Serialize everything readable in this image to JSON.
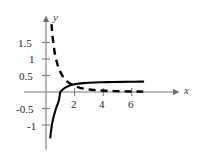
{
  "figure": {
    "background_color": "#ffffff",
    "width": 197,
    "height": 157,
    "axis_color": "#6e6e6e",
    "curve_color": "#000000",
    "label_color": "#262626"
  },
  "axes": {
    "x_axis_label": "x",
    "y_axis_label": "y",
    "x_ticks": [
      {
        "value": 2,
        "label": "2"
      },
      {
        "value": 4,
        "label": "4"
      },
      {
        "value": 6,
        "label": "6"
      }
    ],
    "y_ticks": [
      {
        "value": 1.5,
        "label": "1.5"
      },
      {
        "value": 1,
        "label": "1"
      },
      {
        "value": 0.5,
        "label": "0.5"
      },
      {
        "value": -0.5,
        "label": "-0.5"
      },
      {
        "value": -1,
        "label": "-1"
      }
    ],
    "x_range": [
      -0.6,
      7.5
    ],
    "y_range": [
      -1.4,
      2.1
    ],
    "grid": false,
    "origin_px": {
      "x": 46,
      "y": 92
    },
    "px_per_unit": {
      "x": 14.3,
      "y": 33.0
    }
  },
  "chart_data": {
    "type": "line",
    "title": "",
    "xlabel": "x",
    "ylabel": "y",
    "xlim": [
      -0.6,
      7.5
    ],
    "ylim": [
      -1.4,
      2.1
    ],
    "grid": false,
    "legend_position": "none",
    "annotations": [],
    "series": [
      {
        "name": "solid-curve",
        "style": "solid",
        "color": "#000000",
        "linewidth": 2.1,
        "description": "Increasing concave curve with vertical asymptote at x=0, x-intercept at x=1, flattening near y=0.3",
        "x": [
          0.3,
          0.34,
          0.38,
          0.43,
          0.48,
          0.55,
          0.62,
          0.7,
          0.8,
          0.9,
          1.0,
          1.15,
          1.3,
          1.5,
          1.75,
          2.0,
          2.3,
          2.6,
          3.0,
          3.4,
          3.8,
          4.3,
          4.8,
          5.3,
          5.8,
          6.2,
          6.6,
          6.8
        ],
        "y": [
          -1.38,
          -1.22,
          -1.09,
          -0.96,
          -0.85,
          -0.72,
          -0.61,
          -0.5,
          -0.38,
          -0.26,
          0.0,
          0.07,
          0.12,
          0.17,
          0.21,
          0.235,
          0.255,
          0.268,
          0.28,
          0.288,
          0.294,
          0.299,
          0.303,
          0.307,
          0.31,
          0.312,
          0.314,
          0.315
        ]
      },
      {
        "name": "dashed-curve",
        "style": "dashed",
        "color": "#000000",
        "linewidth": 2.4,
        "dash_pattern": "7,5",
        "description": "Decreasing convex curve, high near the y-axis, decaying asymptotically toward y=0 for large x",
        "x": [
          0.38,
          0.45,
          0.52,
          0.6,
          0.7,
          0.8,
          0.9,
          1.0,
          1.15,
          1.3,
          1.5,
          1.7,
          1.9,
          2.1,
          2.4,
          2.8,
          3.2,
          3.7,
          4.2,
          4.8,
          5.4,
          6.0,
          6.5,
          6.8
        ],
        "y": [
          2.06,
          1.72,
          1.45,
          1.21,
          1.0,
          0.84,
          0.71,
          0.61,
          0.49,
          0.4,
          0.31,
          0.25,
          0.2,
          0.165,
          0.125,
          0.09,
          0.068,
          0.05,
          0.038,
          0.028,
          0.021,
          0.016,
          0.013,
          0.011
        ]
      }
    ],
    "intersection_points": [
      {
        "x": 1.72,
        "y": 0.21
      }
    ]
  },
  "ticklabel_positions": {
    "y_1_5": {
      "left": 18,
      "top": 38
    },
    "y_1": {
      "left": 29,
      "top": 54
    },
    "y_0_5": {
      "left": 19,
      "top": 71
    },
    "y_m0_5": {
      "left": 16,
      "top": 104
    },
    "y_m1": {
      "left": 27,
      "top": 121
    },
    "x_2": {
      "left": 70,
      "top": 99
    },
    "x_4": {
      "left": 99,
      "top": 99
    },
    "x_6": {
      "left": 127,
      "top": 99
    },
    "x_name": {
      "left": 184,
      "top": 86
    },
    "y_name": {
      "left": 53,
      "top": 12
    }
  }
}
